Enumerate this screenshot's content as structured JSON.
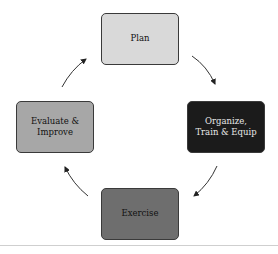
{
  "diagram": {
    "type": "cycle",
    "nodes": [
      {
        "id": "plan",
        "label": "Plan",
        "fill": "#d9d9d9"
      },
      {
        "id": "organize",
        "label_line1": "Organize,",
        "label_line2": "Train & Equip",
        "fill": "#1b1b1b"
      },
      {
        "id": "exercise",
        "label": "Exercise",
        "fill": "#6e6e6e"
      },
      {
        "id": "evaluate",
        "label_line1": "Evaluate &",
        "label_line2": "Improve",
        "fill": "#a7a7a7"
      }
    ],
    "edges": [
      {
        "from": "plan",
        "to": "organize"
      },
      {
        "from": "organize",
        "to": "exercise"
      },
      {
        "from": "exercise",
        "to": "evaluate"
      },
      {
        "from": "evaluate",
        "to": "plan"
      }
    ]
  }
}
